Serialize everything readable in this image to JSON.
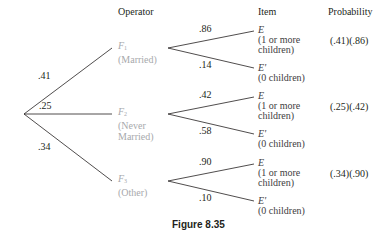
{
  "headers": {
    "operator": "Operator",
    "item": "Item",
    "probability": "Probability"
  },
  "first_level": [
    {
      "edge_prob": ".41",
      "symbol": "F",
      "subscript": "1",
      "desc": "(Married)"
    },
    {
      "edge_prob": ".25",
      "symbol": "F",
      "subscript": "2",
      "desc_line1": "(Never",
      "desc_line2": "Married)"
    },
    {
      "edge_prob": ".34",
      "symbol": "F",
      "subscript": "3",
      "desc": "(Other)"
    }
  ],
  "second_level": [
    {
      "upper": {
        "edge_prob": ".86",
        "symbol": "E",
        "line1": "(1 or more",
        "line2": "children)"
      },
      "lower": {
        "edge_prob": ".14",
        "symbol": "E'",
        "line1": "(0 children)"
      },
      "probability": "(.41)(.86)"
    },
    {
      "upper": {
        "edge_prob": ".42",
        "symbol": "E",
        "line1": "(1 or more",
        "line2": "children)"
      },
      "lower": {
        "edge_prob": ".58",
        "symbol": "E'",
        "line1": "(0 children)"
      },
      "probability": "(.25)(.42)"
    },
    {
      "upper": {
        "edge_prob": ".90",
        "symbol": "E",
        "line1": "(1 or more",
        "line2": "children)"
      },
      "lower": {
        "edge_prob": ".10",
        "symbol": "E'",
        "line1": "(0 children)"
      },
      "probability": "(.34)(.90)"
    }
  ],
  "caption": "Figure 8.35",
  "colors": {
    "line": "#231f20",
    "operator_text": "#a7a9ac",
    "text": "#231f20"
  }
}
